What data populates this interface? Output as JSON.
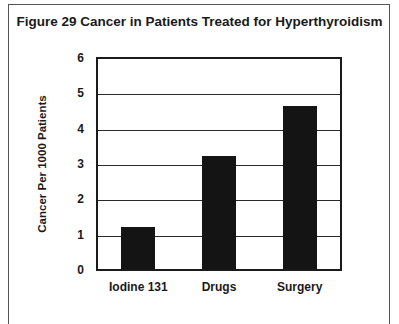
{
  "chart_data": {
    "type": "bar",
    "title": "Figure 29 Cancer in Patients Treated for Hyperthyroidism",
    "categories": [
      "Iodine 131",
      "Drugs",
      "Surgery"
    ],
    "values": [
      1.2,
      3.2,
      4.6
    ],
    "xlabel": "",
    "ylabel": "Cancer Per 1000 Patients",
    "ylim": [
      0,
      6
    ],
    "yticks": [
      "0",
      "1",
      "2",
      "3",
      "4",
      "5",
      "6"
    ],
    "grid": true,
    "legend": null,
    "bar_color": "#141414"
  }
}
